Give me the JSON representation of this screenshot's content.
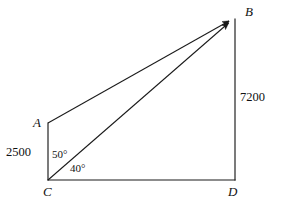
{
  "figure": {
    "kind": "geometry-diagram",
    "canvas": {
      "width": 283,
      "height": 204
    },
    "stroke_color": "#1a1a1a",
    "background_color": "#ffffff",
    "text_color": "#111111"
  },
  "vertices": [
    {
      "id": "A",
      "label": "A",
      "x": 48,
      "y": 123,
      "label_x": 33,
      "label_y": 118
    },
    {
      "id": "B",
      "label": "B",
      "x": 233,
      "y": 19,
      "label_x": 245,
      "label_y": 6
    },
    {
      "id": "C",
      "label": "C",
      "x": 48,
      "y": 180,
      "label_x": 43,
      "label_y": 186
    },
    {
      "id": "D",
      "label": "D",
      "x": 235,
      "y": 180,
      "label_x": 229,
      "label_y": 186
    }
  ],
  "segments": [
    {
      "id": "AC",
      "from": "A",
      "to": "C",
      "arrow": false
    },
    {
      "id": "CD",
      "from": "C",
      "to": "D",
      "arrow": false
    },
    {
      "id": "BD",
      "from": "B",
      "to": "D",
      "arrow": false
    },
    {
      "id": "AB",
      "from": "A",
      "to": "B",
      "arrow": true
    },
    {
      "id": "CB",
      "from": "C",
      "to": "B",
      "arrow": true
    }
  ],
  "measurements": [
    {
      "id": "AC-length",
      "value": "2500",
      "x": 6,
      "y": 147,
      "for_segment": "AC"
    },
    {
      "id": "BD-length",
      "value": "7200",
      "x": 240,
      "y": 91,
      "for_segment": "BD"
    }
  ],
  "angles": [
    {
      "id": "angle-ACB",
      "value": "50°",
      "x": 52,
      "y": 149,
      "at_vertex": "C",
      "between": "CA-CB"
    },
    {
      "id": "angle-BCD",
      "value": "40°",
      "x": 70,
      "y": 163,
      "at_vertex": "C",
      "between": "CB-CD"
    }
  ]
}
